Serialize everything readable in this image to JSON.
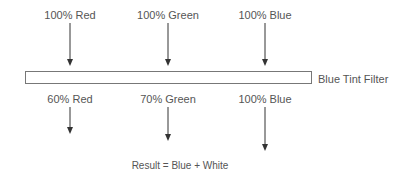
{
  "diagram": {
    "input_labels": [
      "100% Red",
      "100% Green",
      "100% Blue"
    ],
    "filter_label": "Blue Tint Filter",
    "output_labels": [
      "60% Red",
      "70% Green",
      "100% Blue"
    ],
    "result": "Result = Blue + White"
  }
}
